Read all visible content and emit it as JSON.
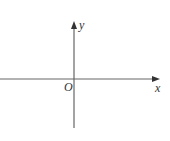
{
  "diagram": {
    "type": "cartesian-axes",
    "axes": {
      "x_label": "x",
      "y_label": "y",
      "origin_label": "O"
    },
    "colors": {
      "axis": "#666666",
      "text": "#333333",
      "background": "#ffffff"
    }
  }
}
